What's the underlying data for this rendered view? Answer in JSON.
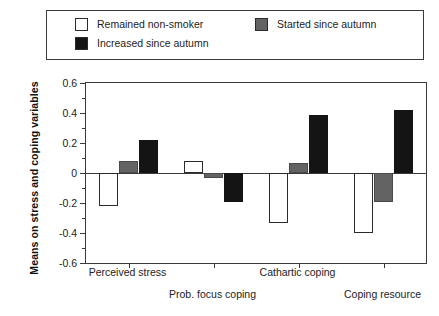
{
  "legend": {
    "entries": [
      {
        "label": "Remained non-smoker",
        "swatch": "white-square-icon",
        "color": "#ffffff"
      },
      {
        "label": "Increased since autumn",
        "swatch": "black-square-icon",
        "color": "#141414"
      },
      {
        "label": "Started since autumn",
        "swatch": "gray-square-icon",
        "color": "#636363"
      }
    ]
  },
  "axes": {
    "y_title": "Means on stress and coping variables",
    "y_ticks": [
      "0.6",
      "0.4",
      "0.2",
      "0",
      "-0.2",
      "-0.4",
      "-0.6"
    ],
    "y_tick_values": [
      0.6,
      0.4,
      0.2,
      0,
      -0.2,
      -0.4,
      -0.6
    ],
    "y_minor_values": [
      0.5,
      0.3,
      0.1,
      -0.1,
      -0.3,
      -0.5
    ],
    "x_title": ""
  },
  "chart_data": {
    "type": "bar",
    "title": "",
    "xlabel": "",
    "ylabel": "Means on stress and coping variables",
    "ylim": [
      -0.6,
      0.6
    ],
    "grid": false,
    "legend_position": "top",
    "categories": [
      "Perceived stress",
      "Prob. focus coping",
      "Cathartic coping",
      "Coping resource"
    ],
    "series": [
      {
        "name": "Remained non-smoker",
        "color": "#ffffff",
        "values": [
          -0.22,
          0.08,
          -0.33,
          -0.4
        ]
      },
      {
        "name": "Started since autumn",
        "color": "#636363",
        "values": [
          0.08,
          -0.03,
          0.07,
          -0.19
        ]
      },
      {
        "name": "Increased since autumn",
        "color": "#141414",
        "values": [
          0.22,
          -0.19,
          0.39,
          0.42
        ]
      }
    ]
  }
}
